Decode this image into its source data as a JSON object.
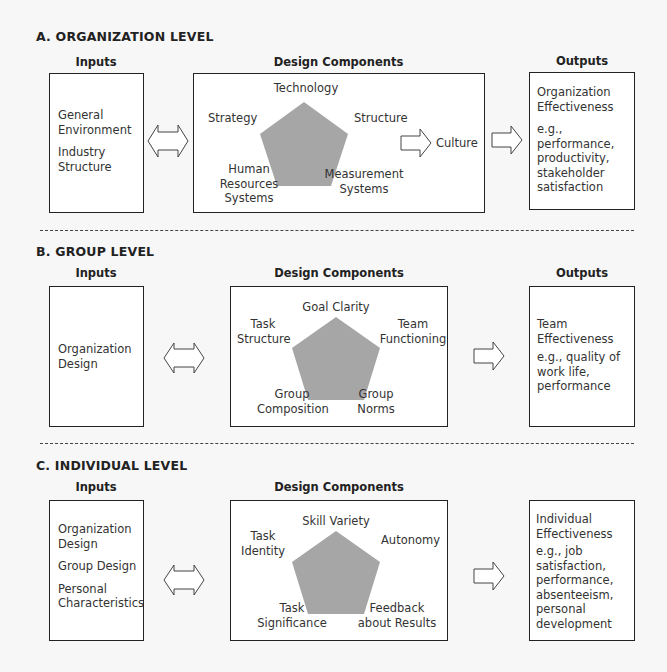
{
  "sections": {
    "organization": {
      "title": "A. ORGANIZATION LEVEL",
      "inputs_header": "Inputs",
      "design_header": "Design Components",
      "outputs_header": "Outputs",
      "inputs": [
        "General",
        "Environment",
        "Industry",
        "Structure"
      ],
      "components": {
        "top": "Technology",
        "left": "Strategy",
        "right": "Structure",
        "bottom_left": [
          "Human",
          "Resources",
          "Systems"
        ],
        "bottom_right": [
          "Measurement",
          "Systems"
        ]
      },
      "culture_label": "Culture",
      "outputs": {
        "title": [
          "Organization",
          "Effectiveness"
        ],
        "examples": [
          "e.g., performance,",
          "productivity,",
          "stakeholder",
          "satisfaction"
        ]
      }
    },
    "group": {
      "title": "B. GROUP LEVEL",
      "inputs_header": "Inputs",
      "design_header": "Design Components",
      "outputs_header": "Outputs",
      "inputs": [
        "Organization",
        "Design"
      ],
      "components": {
        "top": "Goal Clarity",
        "left": [
          "Task",
          "Structure"
        ],
        "right": [
          "Team",
          "Functioning"
        ],
        "bottom_left": [
          "Group",
          "Composition"
        ],
        "bottom_right": [
          "Group",
          "Norms"
        ]
      },
      "outputs": {
        "title": [
          "Team",
          "Effectiveness"
        ],
        "examples": [
          "e.g., quality of",
          "work life,",
          "performance"
        ]
      }
    },
    "individual": {
      "title": "C. INDIVIDUAL LEVEL",
      "inputs_header": "Inputs",
      "design_header": "Design Components",
      "inputs": [
        "Organization",
        "Design",
        "Group Design",
        "Personal",
        "Characteristics"
      ],
      "components": {
        "top": "Skill Variety",
        "left": [
          "Task",
          "Identity"
        ],
        "right": "Autonomy",
        "bottom_left": [
          "Task",
          "Significance"
        ],
        "bottom_right": [
          "Feedback",
          "about Results"
        ]
      },
      "outputs": {
        "title": [
          "Individual",
          "Effectiveness"
        ],
        "examples": [
          "e.g., job",
          "satisfaction,",
          "performance,",
          "absenteeism,",
          "personal",
          "development"
        ]
      }
    }
  },
  "colors": {
    "pentagon_fill": "#a6a6a6",
    "border": "#222222",
    "background": "#f7f7f7"
  }
}
